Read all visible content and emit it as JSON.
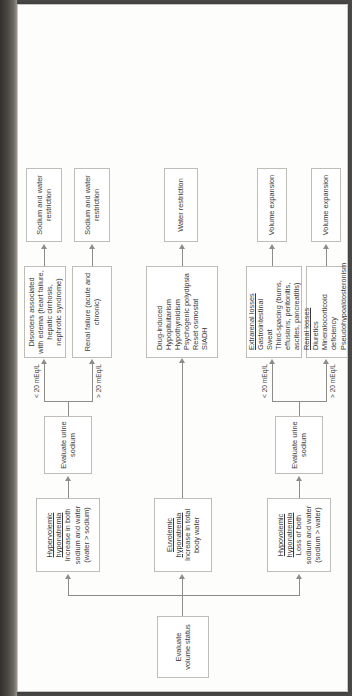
{
  "diagram": {
    "type": "flowchart",
    "orientation": "rotated-90-ccw-on-page",
    "root": {
      "label": "Evaluate volume status"
    },
    "branches": [
      {
        "id": "hypovolemic",
        "title": "Hypovolemic hyponatremia",
        "subtitle": "Loss of both sodium and water (sodium > water)",
        "decision": "Evaluate urine sodium",
        "paths": [
          {
            "threshold": "> 20 mEq/L",
            "causes_title": "Renal losses",
            "causes": [
              "Diuretics",
              "Mineralocorticoid deficiency",
              "Pseudohypoaldosteronism",
              "Salt-wasting nephropathy"
            ],
            "treatment": "Volume expansion"
          },
          {
            "threshold": "< 20 mEq/L",
            "causes_title": "Extrarenal losses",
            "causes": [
              "Gastrointestinal",
              "Sweat",
              "Third-spacing (burns, effusions, peritonitis, ascites, pancreatitis)"
            ],
            "treatment": "Volume expansion"
          }
        ]
      },
      {
        "id": "euvolemic",
        "title": "Euvolemic hyponatremia",
        "subtitle": "Increase in total body water",
        "decision": null,
        "paths": [
          {
            "threshold": null,
            "causes_title": null,
            "causes": [
              "Drug-induced",
              "Hypopituitarism",
              "Hypothyroidism",
              "Psychogenic polydipsia",
              "Reset osmostat",
              "SIADH"
            ],
            "treatment": "Water restriction"
          }
        ]
      },
      {
        "id": "hypervolemic",
        "title": "Hypervolemic hyponatremia",
        "subtitle": "Increase in both sodium and water (water > sodium)",
        "decision": "Evaluate urine sodium",
        "paths": [
          {
            "threshold": "> 20 mEq/L",
            "causes_title": null,
            "causes": [
              "Renal failure (acute and chronic)"
            ],
            "treatment": "Sodium and water restriction"
          },
          {
            "threshold": "< 20 mEq/L",
            "causes_title": null,
            "causes": [
              "Disorders associated with edema (heart failure, hepatic cirrhosis, nephrotic syndrome)"
            ],
            "treatment": "Sodium and water restriction"
          }
        ]
      }
    ]
  },
  "nodes": {
    "root": "Evaluate volume status",
    "hypo_title": "Hypovolemic hyponatremia",
    "hypo_sub": "Loss of both sodium and water (sodium > water)",
    "hypo_decision": "Evaluate urine sodium",
    "hypo_gt_label": "> 20 mEq/L",
    "hypo_lt_label": "< 20 mEq/L",
    "hypo_renal_title": "Renal losses",
    "hypo_renal_body": "Diuretics\nMineralocorticoid deficiency\nPseudohypoaldosteronism\nSalt-wasting nephropathy",
    "hypo_renal_tx": "Volume expansion",
    "hypo_extra_title": "Extrarenal losses",
    "hypo_extra_body": "Gastrointestinal\nSweat\nThird-spacing (burns, effusions, peritonitis, ascites, pancreatitis)",
    "hypo_extra_tx": "Volume expansion",
    "eu_title": "Euvolemic hyponatremia",
    "eu_sub": "Increase in total body water",
    "eu_causes": "Drug-induced\nHypopituitarism\nHypothyroidism\nPsychogenic polydipsia\nReset osmostat\nSIADH",
    "eu_tx": "Water restriction",
    "hyper_title": "Hypervolemic hyponatremia",
    "hyper_sub": "Increase in both sodium and water (water > sodium)",
    "hyper_decision": "Evaluate urine sodium",
    "hyper_gt_label": "> 20 mEq/L",
    "hyper_lt_label": "< 20 mEq/L",
    "hyper_renalfail": "Renal failure (acute and chronic)",
    "hyper_renalfail_tx": "Sodium and water restriction",
    "hyper_edema": "Disorders associated with edema (heart failure, hepatic cirrhosis, nephrotic syndrome)",
    "hyper_edema_tx": "Sodium and water restriction"
  },
  "colors": {
    "page": "#fdfdfc",
    "scan_background": "#4a4947",
    "node_border": "#bfbdb8",
    "connector": "#8e8c88",
    "text": "#3b3b3b"
  }
}
